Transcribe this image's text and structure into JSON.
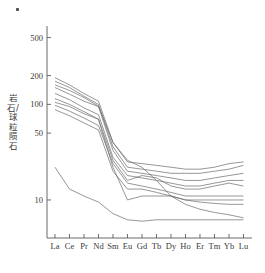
{
  "figure": {
    "corner_mark": "·",
    "axis_color": "#5a5a5a",
    "line_color": "#6a6a6a"
  },
  "chart_data": {
    "type": "line",
    "title": "",
    "xlabel": "",
    "ylabel": "岩石/球粒陨石",
    "yscale": "log",
    "ylim": [
      4,
      600
    ],
    "grid": false,
    "legend": "none",
    "categories": [
      "La",
      "Ce",
      "Pr",
      "Nd",
      "Sm",
      "Eu",
      "Gd",
      "Tb",
      "Dy",
      "Ho",
      "Er",
      "Tm",
      "Yb",
      "Lu"
    ],
    "ytick_values": [
      500,
      200,
      100,
      50,
      10
    ],
    "ytick_labels": [
      "500",
      "200",
      "100",
      "50",
      "10"
    ],
    "series": [
      {
        "name": "sample-1",
        "values": [
          190,
          160,
          130,
          108,
          40,
          25,
          24,
          23,
          22,
          21,
          21,
          22,
          24,
          25
        ]
      },
      {
        "name": "sample-2",
        "values": [
          175,
          150,
          122,
          100,
          36,
          22,
          21,
          20,
          19,
          19,
          19,
          20,
          21,
          23
        ]
      },
      {
        "name": "sample-3",
        "values": [
          150,
          128,
          108,
          95,
          33,
          20,
          19,
          18,
          17,
          16,
          16,
          17,
          18,
          19
        ]
      },
      {
        "name": "sample-4",
        "values": [
          130,
          112,
          92,
          78,
          28,
          18,
          17,
          16,
          15,
          14,
          14,
          15,
          16,
          16
        ]
      },
      {
        "name": "sample-5",
        "values": [
          105,
          95,
          80,
          70,
          26,
          16,
          18,
          17,
          14,
          13,
          13,
          14,
          15,
          14
        ]
      },
      {
        "name": "sample-6",
        "values": [
          98,
          85,
          72,
          60,
          24,
          15,
          14,
          13,
          12,
          11,
          11,
          11,
          11,
          11
        ]
      },
      {
        "name": "sample-7",
        "values": [
          88,
          76,
          64,
          54,
          20,
          13,
          13,
          12,
          11,
          10,
          10,
          10,
          10,
          10
        ]
      },
      {
        "name": "sample-8",
        "values": [
          115,
          100,
          84,
          70,
          22,
          10,
          11,
          11,
          11,
          10,
          9.5,
          9.2,
          9,
          9
        ]
      },
      {
        "name": "sample-9",
        "values": [
          160,
          140,
          118,
          96,
          40,
          26,
          22,
          16,
          11,
          9,
          8,
          7.4,
          7,
          6.5
        ]
      },
      {
        "name": "sample-10",
        "values": [
          22,
          13,
          11,
          9.5,
          7.2,
          6.2,
          6.0,
          6.2,
          6.2,
          6.2,
          6.2,
          6.2,
          6.2,
          6.2
        ]
      }
    ]
  }
}
